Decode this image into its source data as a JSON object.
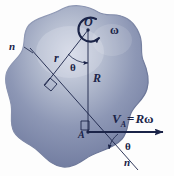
{
  "figure": {
    "background_color": "#fdfdfd",
    "body_fill_color": "#7a85a8",
    "body_outline_color": "#5b6party",
    "ink_color": "#1b2448",
    "labels": {
      "center_point": "O",
      "angular_velocity": "ω",
      "radius_small": "r",
      "radius_big": "R",
      "angle_top": "θ",
      "angle_bottom": "θ",
      "normal_line_left": "n",
      "normal_line_bottom": "n",
      "point_a": "A",
      "velocity_symbol": "V",
      "velocity_subscript": "A",
      "velocity_equals": "=",
      "velocity_value_r": "R",
      "velocity_value_omega": "ω"
    },
    "geometry": {
      "point_o": [
        88,
        28
      ],
      "point_a": [
        88,
        132
      ],
      "r_line_end": [
        45,
        85
      ],
      "n_line_start": [
        30,
        48
      ],
      "n_line_end": [
        138,
        170
      ],
      "velocity_arrow_start": [
        88,
        132
      ],
      "velocity_arrow_end": [
        166,
        132
      ],
      "right_angle_marker_on_r": [
        57,
        78
      ],
      "right_angle_marker_at_a": [
        88,
        132
      ]
    }
  }
}
